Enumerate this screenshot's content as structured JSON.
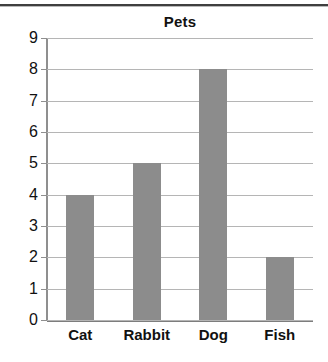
{
  "chart_data": {
    "type": "bar",
    "title": "Pets",
    "xlabel": "",
    "ylabel": "",
    "categories": [
      "Cat",
      "Rabbit",
      "Dog",
      "Fish"
    ],
    "values": [
      4,
      5,
      8,
      2
    ],
    "ylim": [
      0,
      9
    ],
    "yticks": [
      0,
      1,
      2,
      3,
      4,
      5,
      6,
      7,
      8,
      9
    ],
    "ytick_labels": [
      "0",
      "1",
      "2",
      "3",
      "4",
      "5",
      "6",
      "7",
      "8",
      "9"
    ],
    "grid": true,
    "legend": null,
    "bar_color": "#8c8c8c",
    "gridline_color": "#b5b5b5",
    "axis_color": "#8f8f8f",
    "text_color": "#111111"
  }
}
